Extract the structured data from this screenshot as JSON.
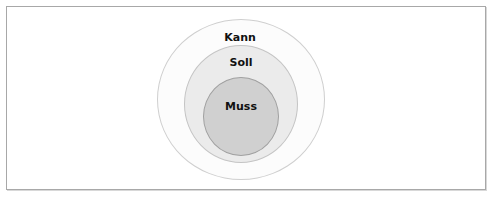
{
  "diagram": {
    "type": "nested-circles",
    "layers": [
      {
        "label": "Kann",
        "level": "outer",
        "fill": "#fcfcfc"
      },
      {
        "label": "Soll",
        "level": "middle",
        "fill": "#ebebeb"
      },
      {
        "label": "Muss",
        "level": "inner",
        "fill": "#d0d0d0"
      }
    ]
  }
}
